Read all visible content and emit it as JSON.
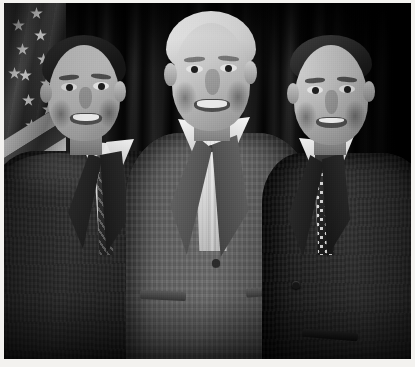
{
  "image": {
    "kind": "photograph",
    "medium": "scanned color photo print, desaturated to black-and-white",
    "orientation": "landscape",
    "width_px": 415,
    "height_px": 367,
    "border": {
      "style": "thin white photo-print margin on all four sides",
      "color": "#f3f2ef",
      "thickness_px": 4
    },
    "caption": "Three men posing together for a group portrait in front of a dark stage curtain with a United States flag at the left.",
    "alt_text": "Black and white photograph of three smiling men standing shoulder to shoulder; the man in the center has white hair and wears an open-collar shirt under a light gray suit jacket, flanked by two dark-haired men in dark suits and neckties. An American flag stands at the far left and a pleated dark curtain fills the background."
  },
  "scene": {
    "setting_label": "Indoor event stage / reception backdrop",
    "background": {
      "name": "dark pleated stage curtain",
      "description": "Vertical draped folds, very dark charcoal to near-black, darker toward the top and right edges",
      "tone_hex": "#111111"
    },
    "flag": {
      "name": "United States flag",
      "position": "far left edge, partially cropped",
      "canton_tone_hex": "#26304a",
      "star_count_visible": 9,
      "stripes_visible": 4,
      "description": "Hanging on a pole, canton with white stars at upper left, diagonal red-and-white stripes falling to the lower left, lower portion lost in shadow"
    },
    "lighting": "Direct on-camera flash from the front; faces brightly lit, background falls off to black",
    "people_count": 3
  },
  "people": [
    {
      "id": "person-left",
      "position_label": "left",
      "description": "Younger man with short dark wavy hair, broad smile",
      "hair": "short dark brown, wavy, swept back",
      "expression": "broad open smile",
      "clothing": {
        "jacket": "dark charcoal suit jacket, notched lapels",
        "jacket_tone_hex": "#262626",
        "shirt": "white dress shirt",
        "shirt_tone_hex": "#e7e4dd",
        "tie": "dark patterned necktie with diagonal stripes",
        "tie_tone_hex": "#3a3836"
      },
      "pose": "standing, body angled slightly toward center, arm behind center figure"
    },
    {
      "id": "person-center",
      "position_label": "center",
      "description": "Older tall man with full white hair, ruddy complexion, warm smile",
      "hair": "full white / silver, parted to the side",
      "expression": "wide smile, teeth showing",
      "clothing": {
        "jacket": "medium gray suit jacket, single-button, flap pockets",
        "jacket_tone_hex": "#61615e",
        "shirt": "light open-collar dress shirt, no necktie, top button undone",
        "shirt_tone_hex": "#eae7e0",
        "tie": "none"
      },
      "pose": "standing centered and tallest, arms around the two men beside him"
    },
    {
      "id": "person-right",
      "position_label": "right",
      "description": "Man with close-cropped dark hair receding at the temples, slight smile",
      "hair": "very short dark hair, receding hairline",
      "expression": "closed-lip smile",
      "clothing": {
        "jacket": "dark charcoal suit jacket, notched lapels, flap pocket",
        "jacket_tone_hex": "#232323",
        "shirt": "white dress shirt",
        "shirt_tone_hex": "#eeebe4",
        "tie": "dark necktie with white polka dots",
        "tie_tone_hex": "#2a2927"
      },
      "pose": "standing, body angled slightly toward center"
    }
  ],
  "flag_stars": [
    {
      "x": 30,
      "y": 8
    },
    {
      "x": 12,
      "y": 20
    },
    {
      "x": 34,
      "y": 30
    },
    {
      "x": 16,
      "y": 44
    },
    {
      "x": 37,
      "y": 54
    },
    {
      "x": 19,
      "y": 70
    },
    {
      "x": 40,
      "y": 78
    },
    {
      "x": 22,
      "y": 95
    },
    {
      "x": 42,
      "y": 104
    },
    {
      "x": 25,
      "y": 120
    },
    {
      "x": 8,
      "y": 68
    }
  ],
  "flag_stripes": [
    {
      "tone": "light",
      "top": 0,
      "height": 15
    },
    {
      "tone": "dark",
      "top": 15,
      "height": 15
    },
    {
      "tone": "light",
      "top": 30,
      "height": 16
    },
    {
      "tone": "dark",
      "top": 46,
      "height": 16
    },
    {
      "tone": "light",
      "top": 62,
      "height": 17
    },
    {
      "tone": "dark",
      "top": 79,
      "height": 18
    }
  ],
  "palette": {
    "print_margin": "#f3f2ef",
    "curtain_dark": "#111111",
    "curtain_black": "#050505",
    "skin_highlight": "#ddd6ca",
    "skin_midtone": "#b3a996",
    "white_hair": "#f2efe9",
    "dark_hair": "#2a251e",
    "gray_suit": "#61615e",
    "dark_suit": "#242424",
    "white_shirt": "#ebe8e1"
  }
}
